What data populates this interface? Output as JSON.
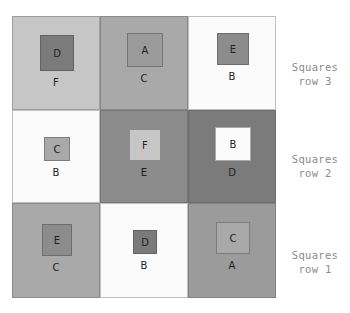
{
  "tones": {
    "A": "#9b9b9b",
    "B": "#fbfbfb",
    "C": "#a9a9a9",
    "D": "#7b7b7b",
    "E": "#8c8c8c",
    "F": "#c6c6c6"
  },
  "rows": [
    {
      "label_line1": "Squares",
      "label_line2": "row 3",
      "cells": [
        {
          "outer": "F",
          "inner": "D"
        },
        {
          "outer": "C",
          "inner": "A"
        },
        {
          "outer": "B",
          "inner": "E"
        }
      ]
    },
    {
      "label_line1": "Squares",
      "label_line2": "row 2",
      "cells": [
        {
          "outer": "B",
          "inner": "C"
        },
        {
          "outer": "E",
          "inner": "F"
        },
        {
          "outer": "D",
          "inner": "B"
        }
      ]
    },
    {
      "label_line1": "Squares",
      "label_line2": "row 1",
      "cells": [
        {
          "outer": "C",
          "inner": "E"
        },
        {
          "outer": "B",
          "inner": "D"
        },
        {
          "outer": "A",
          "inner": "C"
        }
      ]
    }
  ]
}
